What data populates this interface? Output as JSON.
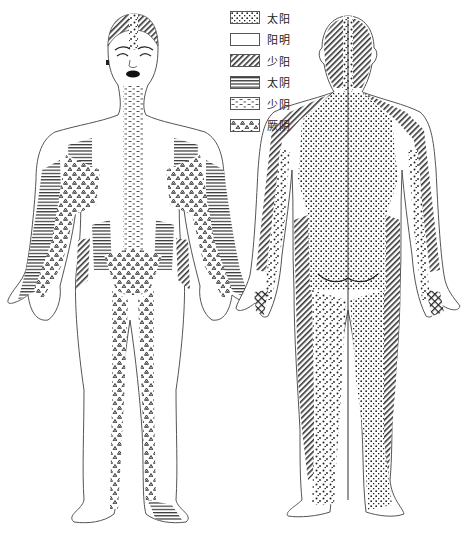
{
  "figure": {
    "title": "",
    "views": [
      {
        "id": "front",
        "label": "",
        "description": "anterior view of human body with meridian skin zones"
      },
      {
        "id": "back",
        "label": "",
        "description": "posterior view of human body with meridian skin zones"
      }
    ]
  },
  "legend": {
    "items": [
      {
        "label": "太阳",
        "pattern": "coarse-dots",
        "pattern_name": "coarse-dots-pattern"
      },
      {
        "label": "阳明",
        "pattern": "blank",
        "pattern_name": "blank-pattern"
      },
      {
        "label": "少阳",
        "pattern": "diagonal-hatch",
        "pattern_name": "diagonal-hatch-pattern"
      },
      {
        "label": "太阴",
        "pattern": "horizontal-lines",
        "pattern_name": "horizontal-lines-pattern"
      },
      {
        "label": "少阴",
        "pattern": "dashes",
        "pattern_name": "dashes-pattern"
      },
      {
        "label": "厥阴",
        "pattern": "triangles",
        "pattern_name": "triangles-pattern"
      }
    ]
  },
  "colors": {
    "ink": "#222222",
    "outline": "#555555",
    "background": "#ffffff"
  }
}
